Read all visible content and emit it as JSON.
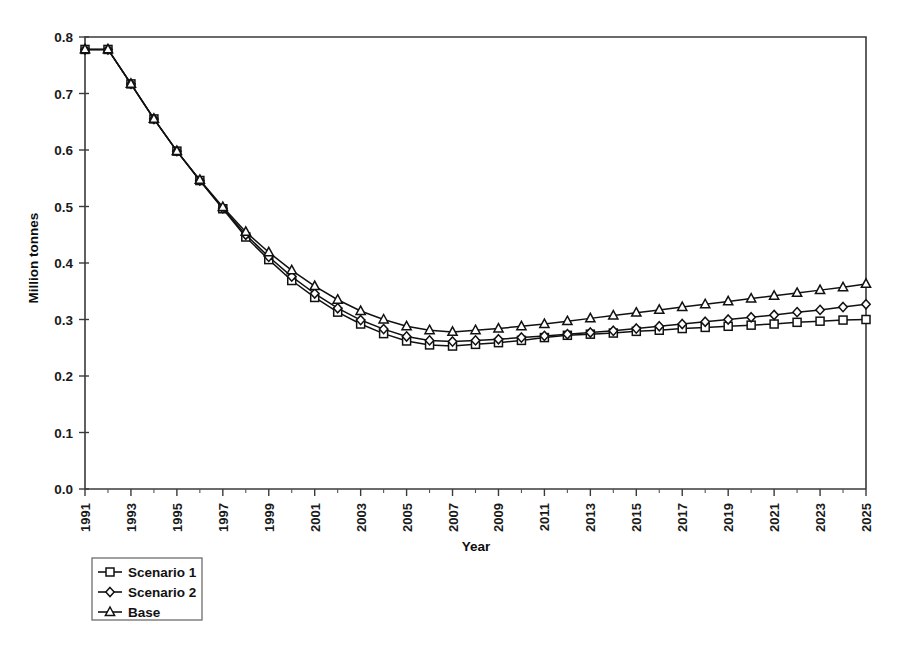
{
  "chart_data": {
    "type": "line",
    "title": "",
    "xlabel": "Year",
    "ylabel": "Million tonnes",
    "xlim": [
      1991,
      2025
    ],
    "ylim": [
      0.0,
      0.8
    ],
    "grid": false,
    "legend_position": "below-left",
    "x": [
      1991,
      1992,
      1993,
      1994,
      1995,
      1996,
      1997,
      1998,
      1999,
      2000,
      2001,
      2002,
      2003,
      2004,
      2005,
      2006,
      2007,
      2008,
      2009,
      2010,
      2011,
      2012,
      2013,
      2014,
      2015,
      2016,
      2017,
      2018,
      2019,
      2020,
      2021,
      2022,
      2023,
      2024,
      2025
    ],
    "xtick_labels": [
      "1991",
      "1993",
      "1995",
      "1997",
      "1999",
      "2001",
      "2003",
      "2005",
      "2007",
      "2009",
      "2011",
      "2013",
      "2015",
      "2017",
      "2019",
      "2021",
      "2023",
      "2025"
    ],
    "ytick_labels": [
      "0.0",
      "0.1",
      "0.2",
      "0.3",
      "0.4",
      "0.5",
      "0.6",
      "0.7",
      "0.8"
    ],
    "ytick_values": [
      0.0,
      0.1,
      0.2,
      0.3,
      0.4,
      0.5,
      0.6,
      0.7,
      0.8
    ],
    "series": [
      {
        "name": "Scenario 1",
        "marker": "square",
        "values": [
          0.778,
          0.778,
          0.717,
          0.655,
          0.598,
          0.546,
          0.496,
          0.446,
          0.406,
          0.369,
          0.339,
          0.313,
          0.292,
          0.275,
          0.262,
          0.255,
          0.253,
          0.256,
          0.259,
          0.263,
          0.268,
          0.272,
          0.274,
          0.276,
          0.279,
          0.281,
          0.284,
          0.286,
          0.288,
          0.29,
          0.292,
          0.295,
          0.297,
          0.299,
          0.3
        ]
      },
      {
        "name": "Scenario 2",
        "marker": "diamond",
        "values": [
          0.778,
          0.778,
          0.717,
          0.655,
          0.598,
          0.546,
          0.497,
          0.45,
          0.411,
          0.376,
          0.346,
          0.32,
          0.299,
          0.283,
          0.27,
          0.263,
          0.261,
          0.263,
          0.265,
          0.268,
          0.271,
          0.274,
          0.277,
          0.28,
          0.284,
          0.288,
          0.292,
          0.296,
          0.3,
          0.304,
          0.308,
          0.313,
          0.317,
          0.322,
          0.327
        ]
      },
      {
        "name": "Base",
        "marker": "triangle",
        "values": [
          0.778,
          0.778,
          0.717,
          0.655,
          0.598,
          0.547,
          0.499,
          0.455,
          0.419,
          0.387,
          0.359,
          0.335,
          0.315,
          0.3,
          0.288,
          0.281,
          0.278,
          0.281,
          0.284,
          0.288,
          0.292,
          0.297,
          0.302,
          0.307,
          0.312,
          0.317,
          0.322,
          0.327,
          0.332,
          0.337,
          0.342,
          0.347,
          0.352,
          0.357,
          0.363
        ]
      }
    ]
  },
  "legend": {
    "entries": [
      {
        "label": "Scenario 1",
        "marker": "square"
      },
      {
        "label": "Scenario 2",
        "marker": "diamond"
      },
      {
        "label": "Base",
        "marker": "triangle"
      }
    ]
  },
  "colors": {
    "line": "#111111",
    "marker_fill": "#ffffff",
    "axis": "#3a3a3a",
    "background": "#ffffff"
  }
}
